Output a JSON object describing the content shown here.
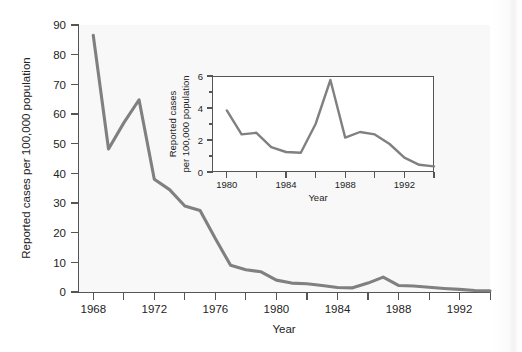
{
  "figure": {
    "background_color": "#ffffff",
    "line_color": "#808080",
    "axis_color": "#555555"
  },
  "chart_data": [
    {
      "id": "main",
      "type": "line",
      "title": "",
      "xlabel": "Year",
      "ylabel": "Reported cases per 100,000 population",
      "xlim": [
        1967,
        1994
      ],
      "ylim": [
        0,
        90
      ],
      "grid": false,
      "legend": "none",
      "x_tick_labels": [
        "1968",
        "1972",
        "1976",
        "1980",
        "1984",
        "1988",
        "1992"
      ],
      "x_tick_values": [
        1968,
        1972,
        1976,
        1980,
        1984,
        1988,
        1992
      ],
      "x_minor_tick_values": [
        1970,
        1974,
        1978,
        1982,
        1986,
        1990,
        1994
      ],
      "y_tick_labels": [
        "0",
        "10",
        "20",
        "30",
        "40",
        "50",
        "60",
        "70",
        "80",
        "90"
      ],
      "y_tick_values": [
        0,
        10,
        20,
        30,
        40,
        50,
        60,
        70,
        80,
        90
      ],
      "x": [
        1968,
        1969,
        1970,
        1971,
        1972,
        1973,
        1974,
        1975,
        1976,
        1977,
        1978,
        1979,
        1980,
        1981,
        1982,
        1983,
        1984,
        1985,
        1986,
        1987,
        1988,
        1989,
        1990,
        1991,
        1992,
        1993,
        1994
      ],
      "values": [
        86.5,
        48.2,
        57.0,
        64.8,
        38.0,
        34.5,
        29.0,
        27.5,
        18.0,
        9.0,
        7.5,
        6.8,
        4.0,
        3.0,
        2.8,
        2.2,
        1.5,
        1.4,
        3.0,
        5.0,
        2.2,
        2.0,
        1.6,
        1.2,
        0.9,
        0.5,
        0.4
      ]
    },
    {
      "id": "inset",
      "type": "line",
      "title": "",
      "xlabel": "Year",
      "ylabel": "Reported cases per 100,000 population",
      "ylabel_line1": "Reported cases",
      "ylabel_line2": "per 100,000 population",
      "xlim": [
        1979,
        1994
      ],
      "ylim": [
        0,
        6
      ],
      "grid": false,
      "legend": "none",
      "x_tick_labels": [
        "1980",
        "1984",
        "1988",
        "1992"
      ],
      "x_tick_values": [
        1980,
        1984,
        1988,
        1992
      ],
      "x_minor_tick_values": [
        1982,
        1986,
        1990,
        1994
      ],
      "y_tick_labels": [
        "0",
        "2",
        "4",
        "6"
      ],
      "y_tick_values": [
        0,
        2,
        4,
        6
      ],
      "y_minor_tick_values": [
        1,
        3,
        5
      ],
      "x": [
        1980,
        1981,
        1982,
        1983,
        1984,
        1985,
        1986,
        1987,
        1988,
        1989,
        1990,
        1991,
        1992,
        1993,
        1994
      ],
      "values": [
        3.85,
        2.35,
        2.45,
        1.55,
        1.25,
        1.2,
        3.0,
        5.75,
        2.15,
        2.5,
        2.35,
        1.75,
        0.9,
        0.45,
        0.35
      ]
    }
  ]
}
